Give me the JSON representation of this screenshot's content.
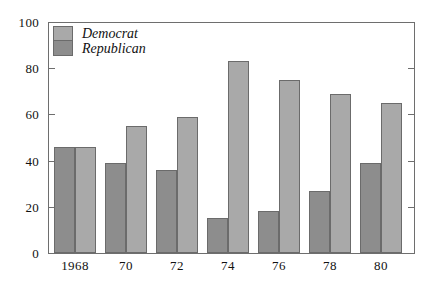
{
  "chart_data": {
    "type": "bar",
    "title": "",
    "subtitle": "",
    "xlabel": "",
    "ylabel": "",
    "categories": [
      "1968",
      "70",
      "72",
      "74",
      "76",
      "78",
      "80"
    ],
    "series": [
      {
        "name": "Republican",
        "color": "#8d8d8d",
        "values": [
          46,
          39,
          36,
          15,
          18,
          27,
          39
        ]
      },
      {
        "name": "Democrat",
        "color": "#a9a9a9",
        "values": [
          46,
          55,
          59,
          83,
          75,
          69,
          65
        ]
      }
    ],
    "series_draw_order": [
      "Republican",
      "Democrat"
    ],
    "ylim": [
      0,
      100
    ],
    "yticks": [
      0,
      20,
      40,
      60,
      80,
      100
    ],
    "ytick_labels": [
      "0",
      "20",
      "40",
      "60",
      "80",
      "100"
    ],
    "xtick_labels": [
      "1968",
      "70",
      "72",
      "74",
      "76",
      "78",
      "80"
    ],
    "grid": false,
    "legend_position": "top-left",
    "legend_entries": [
      {
        "label": "Democrat",
        "color": "#a9a9a9"
      },
      {
        "label": "Republican",
        "color": "#8d8d8d"
      }
    ],
    "axis_color": "#6e6e6e",
    "background": "#ffffff",
    "frame": "box",
    "tick_direction": "in"
  }
}
